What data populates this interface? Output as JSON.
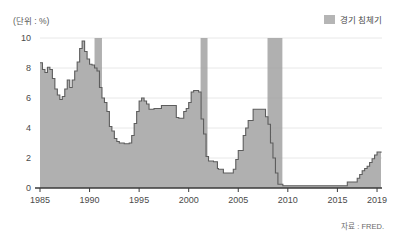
{
  "unit_label": "(단위 : %)",
  "legend": {
    "items": [
      {
        "label": "경기 침체기",
        "color": "#b5b5b5",
        "name": "recession-period"
      }
    ]
  },
  "source": "자료 : FRED.",
  "chart_data": {
    "type": "area",
    "title": "",
    "subtitle": "",
    "xlabel": "",
    "ylabel": "",
    "unit": "%",
    "grid": true,
    "legend_position": "top-right",
    "xlim": [
      1985,
      2019.5
    ],
    "ylim": [
      0,
      10
    ],
    "yticks": [
      0,
      2,
      4,
      6,
      8,
      10
    ],
    "ytick_labels": [
      "0",
      "2",
      "4",
      "6",
      "8",
      "10"
    ],
    "xticks": [
      1985,
      1990,
      1995,
      2000,
      2005,
      2010,
      2015,
      2019
    ],
    "xtick_labels": [
      "1985",
      "1990",
      "1995",
      "2000",
      "2005",
      "2010",
      "2015",
      "2019"
    ],
    "series": [
      {
        "name": "정책금리",
        "fill_color": "#b0b0b0",
        "line_color": "#5d5d5d",
        "x": [
          1985.0,
          1985.25,
          1985.5,
          1985.75,
          1986.0,
          1986.25,
          1986.5,
          1986.75,
          1987.0,
          1987.25,
          1987.5,
          1987.75,
          1988.0,
          1988.25,
          1988.5,
          1988.75,
          1989.0,
          1989.25,
          1989.5,
          1989.75,
          1990.0,
          1990.25,
          1990.5,
          1990.75,
          1991.0,
          1991.25,
          1991.5,
          1991.75,
          1992.0,
          1992.25,
          1992.5,
          1992.75,
          1993.0,
          1993.5,
          1994.0,
          1994.25,
          1994.5,
          1994.75,
          1995.0,
          1995.25,
          1995.5,
          1995.75,
          1996.0,
          1996.5,
          1997.0,
          1997.25,
          1997.75,
          1998.0,
          1998.5,
          1998.75,
          1999.0,
          1999.5,
          1999.75,
          2000.0,
          2000.25,
          2000.5,
          2000.75,
          2001.0,
          2001.25,
          2001.5,
          2001.75,
          2002.0,
          2002.5,
          2002.9,
          2003.0,
          2003.5,
          2003.75,
          2004.0,
          2004.5,
          2004.75,
          2005.0,
          2005.5,
          2005.75,
          2006.0,
          2006.5,
          2007.0,
          2007.5,
          2007.75,
          2008.0,
          2008.25,
          2008.5,
          2008.75,
          2009.0,
          2009.5,
          2010.0,
          2011.0,
          2012.0,
          2013.0,
          2014.0,
          2015.0,
          2015.9,
          2016.0,
          2016.5,
          2016.9,
          2017.0,
          2017.25,
          2017.5,
          2017.75,
          2018.0,
          2018.25,
          2018.5,
          2018.75,
          2019.0,
          2019.25,
          2019.4
        ],
        "values": [
          8.35,
          7.9,
          7.7,
          8.05,
          7.9,
          7.3,
          6.6,
          6.2,
          5.9,
          6.1,
          6.6,
          7.2,
          6.7,
          7.2,
          7.8,
          8.4,
          9.3,
          9.8,
          9.1,
          8.6,
          8.25,
          8.2,
          8.0,
          7.8,
          6.7,
          6.0,
          5.7,
          5.1,
          4.1,
          3.8,
          3.3,
          3.1,
          3.0,
          2.95,
          3.0,
          3.5,
          4.3,
          5.1,
          5.8,
          6.0,
          5.8,
          5.6,
          5.25,
          5.3,
          5.3,
          5.5,
          5.5,
          5.5,
          5.5,
          4.7,
          4.65,
          5.1,
          5.3,
          5.7,
          6.4,
          6.5,
          6.5,
          6.4,
          4.6,
          3.6,
          2.1,
          1.8,
          1.75,
          1.3,
          1.25,
          1.0,
          1.0,
          1.0,
          1.25,
          1.9,
          2.5,
          3.5,
          4.0,
          4.5,
          5.25,
          5.25,
          5.25,
          4.75,
          4.25,
          3.0,
          2.0,
          1.0,
          0.25,
          0.15,
          0.15,
          0.15,
          0.15,
          0.15,
          0.15,
          0.15,
          0.15,
          0.4,
          0.4,
          0.4,
          0.65,
          0.9,
          1.15,
          1.3,
          1.45,
          1.7,
          1.95,
          2.2,
          2.4,
          2.4,
          2.35
        ]
      }
    ],
    "recession_bands": [
      {
        "label": "1990-1991 경기 침체기",
        "start": 1990.5,
        "end": 1991.25
      },
      {
        "label": "2001 경기 침체기",
        "start": 2001.2,
        "end": 2001.9
      },
      {
        "label": "2008-2009 경기 침체기",
        "start": 2007.95,
        "end": 2009.45
      }
    ]
  }
}
